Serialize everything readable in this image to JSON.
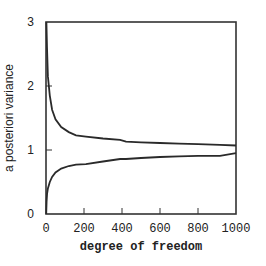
{
  "chart_data": {
    "type": "line",
    "title": "",
    "xlabel": "degree of freedom",
    "ylabel": "a posteriori variance",
    "xlim": [
      0,
      1000
    ],
    "ylim": [
      0,
      3
    ],
    "x_ticks": [
      0,
      200,
      400,
      600,
      800,
      1000
    ],
    "x_tick_labels": [
      "0",
      "200",
      "400",
      "600",
      "800",
      "1000"
    ],
    "y_ticks": [
      0,
      1,
      2,
      3
    ],
    "y_tick_labels": [
      "0",
      "1",
      "2",
      "3"
    ],
    "grid": false,
    "legend": null,
    "series": [
      {
        "name": "upper bound",
        "x": [
          2,
          5,
          10,
          20,
          32,
          50,
          80,
          120,
          158,
          210,
          300,
          390,
          421,
          500,
          600,
          700,
          800,
          916,
          1000
        ],
        "y": [
          3.0,
          2.6,
          2.15,
          1.85,
          1.63,
          1.48,
          1.36,
          1.28,
          1.23,
          1.21,
          1.18,
          1.16,
          1.13,
          1.12,
          1.11,
          1.1,
          1.09,
          1.08,
          1.07
        ]
      },
      {
        "name": "lower bound",
        "x": [
          1,
          3,
          6,
          10,
          20,
          32,
          50,
          80,
          120,
          158,
          210,
          300,
          390,
          421,
          500,
          600,
          700,
          800,
          916,
          1000
        ],
        "y": [
          0.0,
          0.2,
          0.32,
          0.4,
          0.5,
          0.58,
          0.65,
          0.71,
          0.75,
          0.77,
          0.78,
          0.82,
          0.86,
          0.86,
          0.875,
          0.89,
          0.9,
          0.91,
          0.91,
          0.95
        ]
      }
    ]
  }
}
